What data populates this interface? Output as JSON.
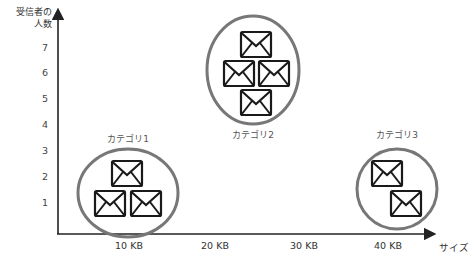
{
  "diagram": {
    "y_axis": {
      "label_line1": "受信者の",
      "label_line2": "人数",
      "ticks": [
        "7",
        "6",
        "5",
        "4",
        "3",
        "2",
        "1"
      ]
    },
    "x_axis": {
      "label": "サイズ",
      "ticks": [
        "10 KB",
        "20 KB",
        "30 KB",
        "40 KB"
      ]
    },
    "categories": [
      {
        "label": "カテゴリ1",
        "envelopes": 3,
        "icon": "envelope-icon"
      },
      {
        "label": "カテゴリ2",
        "envelopes": 4,
        "icon": "envelope-icon"
      },
      {
        "label": "カテゴリ3",
        "envelopes": 2,
        "icon": "envelope-icon"
      }
    ],
    "colors": {
      "axis": "#222222",
      "ellipse": "#777777",
      "envelope": "#1a1a1a"
    }
  }
}
